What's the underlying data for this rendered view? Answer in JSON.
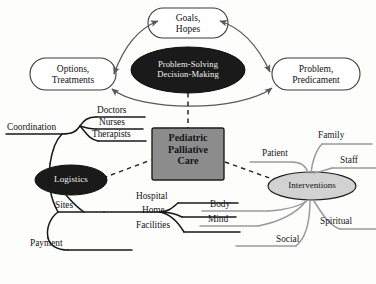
{
  "diagram": {
    "colors": {
      "background": "#fdfdfc",
      "dark_fill": "#1a1a1a",
      "dark_text": "#f2f2f0",
      "gray_box_fill": "#8c8c8c",
      "gray_oval_fill": "#d2d2d2",
      "outline": "#2b2b2b",
      "arrow_stroke": "#58585c",
      "branch_left_stroke": "#18181a",
      "branch_right_stroke": "#9a9a9e",
      "dashed_stroke": "#26262a"
    },
    "center": {
      "name": "Pediatric Palliative Care",
      "lines": "Pediatric\nPalliative\nCare"
    },
    "core_oval": {
      "name": "Problem-Solving Decision-Making",
      "lines": "Problem-Solving\nDecision-Making"
    },
    "corner_nodes": [
      {
        "id": "goals",
        "lines": "Goals,\nHopes"
      },
      {
        "id": "options",
        "lines": "Options,\nTreatments"
      },
      {
        "id": "problem",
        "lines": "Problem,\nPredicament"
      }
    ],
    "left_oval": {
      "id": "logistics",
      "label": "Logistics"
    },
    "right_oval": {
      "id": "interventions",
      "label": "Interventions"
    },
    "left_branches": {
      "coordination": {
        "label": "Coordination",
        "children": [
          "Doctors",
          "Nurses",
          "Therapists"
        ]
      },
      "sites": {
        "label": "Sites",
        "children": [
          "Hospital",
          "Home",
          "Facilities"
        ]
      },
      "payment": {
        "label": "Payment",
        "children": []
      }
    },
    "right_branches": {
      "upper": [
        "Patient",
        "Family",
        "Staff"
      ],
      "lower": [
        "Body",
        "Mind",
        "Social",
        "Spiritual"
      ]
    }
  }
}
